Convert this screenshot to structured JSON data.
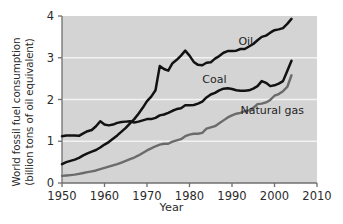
{
  "chart_data": {
    "type": "line",
    "title": "",
    "xlabel": "Year",
    "ylabel": "World fossil fuel consumption (billion tons of oil equivalent)",
    "ylabel_line1": "World fossil fuel consumption",
    "ylabel_line2": "(billion tons of oil equivalent)",
    "xlim": [
      1950,
      2010
    ],
    "ylim": [
      0,
      4
    ],
    "xticks": [
      1950,
      1960,
      1970,
      1980,
      1990,
      2000,
      2010
    ],
    "xticklabels": [
      "1950",
      "1960",
      "1970",
      "1980",
      "1990",
      "2000",
      "2010"
    ],
    "yticks": [
      0,
      1,
      2,
      3,
      4
    ],
    "yticklabels": [
      "0",
      "1",
      "2",
      "3",
      "4"
    ],
    "grid": "horizontal-white",
    "legend_position": "inline-annotations",
    "plot_background": "#d4d4d4",
    "gridline_color": "#f2f2f2",
    "axis_color": "#6f6f6f",
    "series": [
      {
        "name": "Oil",
        "color": "#121212",
        "label_x": 1991.5,
        "label_y": 3.37,
        "x": [
          1950,
          1951,
          1952,
          1953,
          1954,
          1955,
          1956,
          1957,
          1958,
          1959,
          1960,
          1961,
          1962,
          1963,
          1964,
          1965,
          1966,
          1967,
          1968,
          1969,
          1970,
          1971,
          1972,
          1973,
          1974,
          1975,
          1976,
          1977,
          1978,
          1979,
          1980,
          1981,
          1982,
          1983,
          1984,
          1985,
          1986,
          1987,
          1988,
          1989,
          1990,
          1991,
          1992,
          1993,
          1994,
          1995,
          1996,
          1997,
          1998,
          1999,
          2000,
          2001,
          2002,
          2003,
          2004
        ],
        "y": [
          0.45,
          0.5,
          0.53,
          0.56,
          0.6,
          0.66,
          0.71,
          0.75,
          0.79,
          0.85,
          0.92,
          0.98,
          1.06,
          1.14,
          1.23,
          1.32,
          1.43,
          1.53,
          1.66,
          1.8,
          1.96,
          2.07,
          2.22,
          2.8,
          2.73,
          2.69,
          2.87,
          2.95,
          3.05,
          3.17,
          3.05,
          2.9,
          2.83,
          2.82,
          2.88,
          2.89,
          2.98,
          3.04,
          3.12,
          3.16,
          3.16,
          3.17,
          3.21,
          3.21,
          3.27,
          3.33,
          3.42,
          3.5,
          3.53,
          3.6,
          3.66,
          3.68,
          3.71,
          3.81,
          3.93
        ]
      },
      {
        "name": "Coal",
        "color": "#121212",
        "label_x": 1983.0,
        "label_y": 2.47,
        "x": [
          1950,
          1951,
          1952,
          1953,
          1954,
          1955,
          1956,
          1957,
          1958,
          1959,
          1960,
          1961,
          1962,
          1963,
          1964,
          1965,
          1966,
          1967,
          1968,
          1969,
          1970,
          1971,
          1972,
          1973,
          1974,
          1975,
          1976,
          1977,
          1978,
          1979,
          1980,
          1981,
          1982,
          1983,
          1984,
          1985,
          1986,
          1987,
          1988,
          1989,
          1990,
          1991,
          1992,
          1993,
          1994,
          1995,
          1996,
          1997,
          1998,
          1999,
          2000,
          2001,
          2002,
          2003,
          2004
        ],
        "y": [
          1.12,
          1.14,
          1.14,
          1.14,
          1.13,
          1.19,
          1.24,
          1.27,
          1.36,
          1.48,
          1.4,
          1.38,
          1.4,
          1.44,
          1.46,
          1.47,
          1.48,
          1.45,
          1.47,
          1.5,
          1.53,
          1.53,
          1.56,
          1.62,
          1.64,
          1.68,
          1.73,
          1.77,
          1.79,
          1.86,
          1.86,
          1.87,
          1.9,
          1.95,
          2.05,
          2.12,
          2.16,
          2.22,
          2.26,
          2.27,
          2.25,
          2.22,
          2.21,
          2.21,
          2.22,
          2.26,
          2.32,
          2.44,
          2.4,
          2.32,
          2.34,
          2.38,
          2.44,
          2.68,
          2.93
        ]
      },
      {
        "name": "Natural gas",
        "color": "#6b6b6b",
        "label_x": 1992.0,
        "label_y": 1.72,
        "x": [
          1950,
          1951,
          1952,
          1953,
          1954,
          1955,
          1956,
          1957,
          1958,
          1959,
          1960,
          1961,
          1962,
          1963,
          1964,
          1965,
          1966,
          1967,
          1968,
          1969,
          1970,
          1971,
          1972,
          1973,
          1974,
          1975,
          1976,
          1977,
          1978,
          1979,
          1980,
          1981,
          1982,
          1983,
          1984,
          1985,
          1986,
          1987,
          1988,
          1989,
          1990,
          1991,
          1992,
          1993,
          1994,
          1995,
          1996,
          1997,
          1998,
          1999,
          2000,
          2001,
          2002,
          2003,
          2004
        ],
        "y": [
          0.17,
          0.18,
          0.19,
          0.2,
          0.22,
          0.24,
          0.26,
          0.28,
          0.3,
          0.33,
          0.36,
          0.39,
          0.42,
          0.45,
          0.49,
          0.53,
          0.57,
          0.61,
          0.66,
          0.72,
          0.78,
          0.83,
          0.88,
          0.92,
          0.94,
          0.94,
          0.99,
          1.02,
          1.05,
          1.12,
          1.16,
          1.18,
          1.18,
          1.2,
          1.3,
          1.33,
          1.36,
          1.43,
          1.5,
          1.57,
          1.62,
          1.66,
          1.68,
          1.72,
          1.74,
          1.8,
          1.89,
          1.9,
          1.93,
          1.99,
          2.09,
          2.13,
          2.2,
          2.3,
          2.58
        ]
      }
    ]
  },
  "axis": {
    "ylabel_line1": "World fossil fuel consumption",
    "ylabel_line2": "(billion tons of oil equivalent)",
    "xlabel": "Year"
  }
}
